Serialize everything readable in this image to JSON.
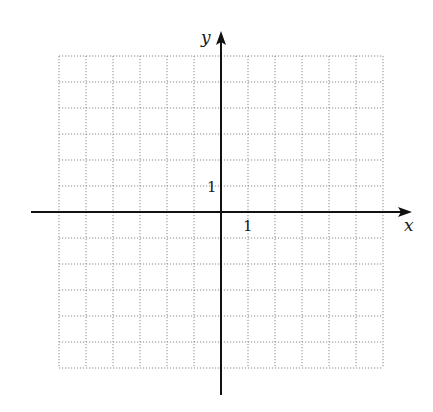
{
  "diagram": {
    "type": "coordinate-plane",
    "grid": {
      "columns": 12,
      "rows": 12,
      "x_range": [
        -6,
        6
      ],
      "y_range": [
        -6,
        6
      ],
      "line_style": "dotted",
      "line_color": "#8a8a8a"
    },
    "axes": {
      "x_label": "x",
      "y_label": "y",
      "color": "#111111"
    },
    "tick_labels": {
      "x_unit": "1",
      "y_unit": "1"
    }
  }
}
